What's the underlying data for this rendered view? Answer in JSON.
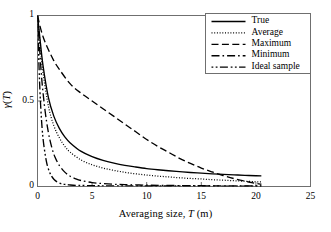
{
  "chart_data": {
    "type": "line",
    "title": "",
    "xlabel": "Averaging size, T (m)",
    "xlabel_parts": {
      "pre": "Averaging size, ",
      "symbol": "T",
      "post": " (m)"
    },
    "ylabel": "γ(T)",
    "ylabel_parts": {
      "symbol": "γ",
      "arg_open": "(",
      "arg": "T",
      "arg_close": ")"
    },
    "xlim": [
      0,
      25
    ],
    "ylim": [
      0,
      1
    ],
    "xticks": [
      0,
      5,
      10,
      15,
      20,
      25
    ],
    "xtick_labels": [
      "0",
      "5",
      "10",
      "15",
      "20",
      "25"
    ],
    "yticks": [
      0,
      0.5,
      1
    ],
    "ytick_labels": [
      "0",
      "0.5",
      "1"
    ],
    "grid": false,
    "legend_position": "top-right",
    "series": [
      {
        "name": "True",
        "style": "solid",
        "x": [
          0,
          0.2,
          0.5,
          1,
          1.5,
          2,
          2.5,
          3,
          4,
          5,
          6,
          7,
          8,
          9,
          10,
          11,
          12,
          13,
          14,
          15,
          16,
          17,
          18,
          19,
          20,
          20.5
        ],
        "y": [
          1.0,
          0.88,
          0.71,
          0.52,
          0.41,
          0.34,
          0.29,
          0.255,
          0.205,
          0.175,
          0.153,
          0.137,
          0.124,
          0.114,
          0.105,
          0.098,
          0.092,
          0.087,
          0.082,
          0.078,
          0.074,
          0.071,
          0.068,
          0.065,
          0.063,
          0.062
        ]
      },
      {
        "name": "Average",
        "style": "dotted",
        "x": [
          0,
          0.2,
          0.5,
          1,
          1.5,
          2,
          2.5,
          3,
          4,
          5,
          6,
          7,
          8,
          9,
          10,
          11,
          12,
          13,
          14,
          15,
          16,
          17,
          18,
          19,
          20,
          20.5
        ],
        "y": [
          1.0,
          0.86,
          0.67,
          0.47,
          0.355,
          0.285,
          0.235,
          0.2,
          0.155,
          0.127,
          0.108,
          0.094,
          0.083,
          0.074,
          0.067,
          0.061,
          0.056,
          0.051,
          0.047,
          0.044,
          0.04,
          0.037,
          0.034,
          0.031,
          0.028,
          0.027
        ]
      },
      {
        "name": "Maximum",
        "style": "dashed",
        "x": [
          0,
          0.3,
          0.6,
          1,
          1.5,
          2,
          3,
          4,
          5,
          6,
          7,
          8,
          9,
          10,
          11,
          12,
          13,
          14,
          15,
          16,
          17,
          18,
          19,
          20,
          20.5
        ],
        "y": [
          1.0,
          0.92,
          0.86,
          0.8,
          0.735,
          0.685,
          0.6,
          0.545,
          0.5,
          0.455,
          0.41,
          0.365,
          0.32,
          0.275,
          0.235,
          0.2,
          0.165,
          0.135,
          0.108,
          0.085,
          0.064,
          0.046,
          0.031,
          0.018,
          0.013
        ]
      },
      {
        "name": "Minimum",
        "style": "dashdot",
        "x": [
          0,
          0.2,
          0.4,
          0.7,
          1,
          1.3,
          1.6,
          2,
          2.5,
          3,
          3.5,
          4,
          5,
          6,
          7,
          8,
          10,
          12,
          14,
          16,
          18,
          20,
          20.5
        ],
        "y": [
          1.0,
          0.8,
          0.62,
          0.44,
          0.315,
          0.23,
          0.172,
          0.123,
          0.084,
          0.06,
          0.045,
          0.035,
          0.023,
          0.017,
          0.013,
          0.011,
          0.008,
          0.006,
          0.005,
          0.004,
          0.003,
          0.003,
          0.003
        ]
      },
      {
        "name": "Ideal sample",
        "style": "dashdotdot",
        "x": [
          0,
          0.15,
          0.3,
          0.5,
          0.8,
          1.1,
          1.5,
          2,
          2.5,
          3,
          3.5,
          4,
          5,
          6,
          8,
          10,
          12,
          14,
          16,
          18,
          20,
          20.5
        ],
        "y": [
          1.0,
          0.68,
          0.46,
          0.285,
          0.152,
          0.085,
          0.042,
          0.02,
          0.012,
          0.009,
          0.007,
          0.006,
          0.005,
          0.004,
          0.004,
          0.003,
          0.003,
          0.003,
          0.003,
          0.002,
          0.002,
          0.002
        ]
      }
    ]
  },
  "legend": {
    "items": [
      {
        "label": "True",
        "style": "solid"
      },
      {
        "label": "Average",
        "style": "dotted"
      },
      {
        "label": "Maximum",
        "style": "dashed"
      },
      {
        "label": "Minimum",
        "style": "dashdot"
      },
      {
        "label": "Ideal sample",
        "style": "dashdotdot"
      }
    ]
  }
}
